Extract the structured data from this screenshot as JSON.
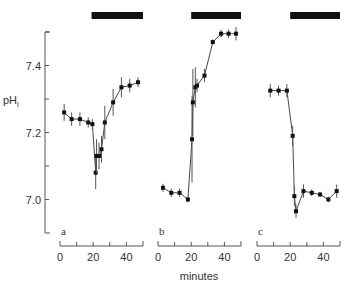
{
  "chart_data": {
    "type": "line",
    "title": "",
    "ylabel": "pH",
    "ylabel_sub": "i",
    "xlabel": "minutes",
    "ylim": [
      6.9,
      7.5
    ],
    "yticks": [
      7.0,
      7.1,
      7.2,
      7.3,
      7.4,
      7.5
    ],
    "ytick_labels": [
      "7.0",
      "",
      "7.2",
      "",
      "7.4",
      ""
    ],
    "xlim": [
      0,
      50
    ],
    "xticks": [
      0,
      10,
      20,
      30,
      40,
      50
    ],
    "xtick_labels": [
      "0",
      "",
      "20",
      "",
      "40",
      ""
    ],
    "grid": false,
    "panels": [
      {
        "label": "a",
        "treatment_bar": [
          19,
          50
        ],
        "points": [
          {
            "x": 2.5,
            "y": 7.26,
            "err": 0.025
          },
          {
            "x": 7,
            "y": 7.24,
            "err": 0.02
          },
          {
            "x": 12,
            "y": 7.24,
            "err": 0.02
          },
          {
            "x": 17,
            "y": 7.23,
            "err": 0.015
          },
          {
            "x": 19.5,
            "y": 7.225,
            "err": 0.015
          },
          {
            "x": 21.5,
            "y": 7.08,
            "err": 0.05
          },
          {
            "x": 22,
            "y": 7.13,
            "err": 0.05
          },
          {
            "x": 23.5,
            "y": 7.13,
            "err": 0.04
          },
          {
            "x": 25,
            "y": 7.15,
            "err": 0.04
          },
          {
            "x": 27,
            "y": 7.23,
            "err": 0.05
          },
          {
            "x": 32,
            "y": 7.29,
            "err": 0.04
          },
          {
            "x": 37,
            "y": 7.335,
            "err": 0.03
          },
          {
            "x": 42,
            "y": 7.34,
            "err": 0.02
          },
          {
            "x": 47,
            "y": 7.35,
            "err": 0.015
          }
        ]
      },
      {
        "label": "b",
        "treatment_bar": [
          20,
          50
        ],
        "points": [
          {
            "x": 3,
            "y": 7.035,
            "err": 0.012
          },
          {
            "x": 8,
            "y": 7.02,
            "err": 0.012
          },
          {
            "x": 13,
            "y": 7.02,
            "err": 0.012
          },
          {
            "x": 18,
            "y": 7.0,
            "err": 0.008
          },
          {
            "x": 20.5,
            "y": 7.18,
            "err": 0.13
          },
          {
            "x": 21,
            "y": 7.29,
            "err": 0.1
          },
          {
            "x": 22.5,
            "y": 7.335,
            "err": 0.06
          },
          {
            "x": 23.5,
            "y": 7.34,
            "err": 0.02
          },
          {
            "x": 28,
            "y": 7.37,
            "err": 0.02
          },
          {
            "x": 33,
            "y": 7.47,
            "err": 0.008
          },
          {
            "x": 38,
            "y": 7.495,
            "err": 0.012
          },
          {
            "x": 42.5,
            "y": 7.495,
            "err": 0.012
          },
          {
            "x": 47,
            "y": 7.495,
            "err": 0.02
          }
        ]
      },
      {
        "label": "c",
        "treatment_bar": [
          20,
          50
        ],
        "points": [
          {
            "x": 8,
            "y": 7.325,
            "err": 0.02
          },
          {
            "x": 13,
            "y": 7.325,
            "err": 0.015
          },
          {
            "x": 18,
            "y": 7.325,
            "err": 0.02
          },
          {
            "x": 21.5,
            "y": 7.19,
            "err": 0.03
          },
          {
            "x": 22.5,
            "y": 7.01,
            "err": 0.03
          },
          {
            "x": 23.5,
            "y": 6.965,
            "err": 0.02
          },
          {
            "x": 28,
            "y": 7.025,
            "err": 0.02
          },
          {
            "x": 33,
            "y": 7.02,
            "err": 0.01
          },
          {
            "x": 38,
            "y": 7.015,
            "err": 0.008
          },
          {
            "x": 43,
            "y": 7.0,
            "err": 0.008
          },
          {
            "x": 48,
            "y": 7.025,
            "err": 0.02
          }
        ]
      }
    ]
  }
}
